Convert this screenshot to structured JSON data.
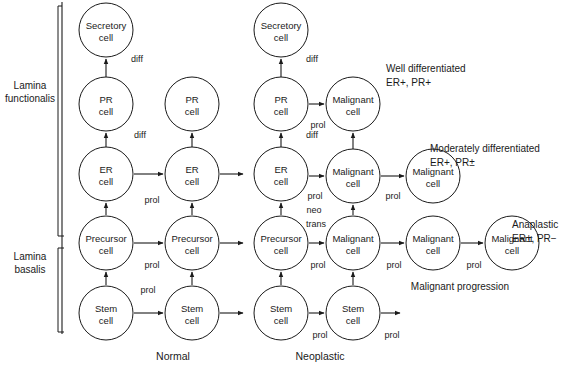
{
  "figure": {
    "columns": [
      {
        "id": "normal",
        "caption": "Normal",
        "x": 173,
        "y": 360
      },
      {
        "id": "neoplastic",
        "caption": "Neoplastic",
        "x": 320,
        "y": 360
      }
    ],
    "side_labels": [
      {
        "id": "lamina-functionalis",
        "line1": "Lamina",
        "line2": "functionalis",
        "x": 30,
        "y": 92
      },
      {
        "id": "lamina-basalis",
        "line1": "Lamina",
        "line2": "basalis",
        "x": 30,
        "y": 263
      }
    ],
    "progression_label": {
      "text": "Malignant progression",
      "x": 460,
      "y": 290
    },
    "annotations": [
      {
        "id": "well-differentiated",
        "line1": "Well differentiated",
        "line2": "ER+, PR+",
        "x": 386,
        "y": 72
      },
      {
        "id": "moderately-differentiated",
        "line1": "Moderately differentiated",
        "line2": "ER+, PR±",
        "x": 430,
        "y": 152
      },
      {
        "id": "anaplastic",
        "line1": "Anaplastic",
        "line2": "ER±, PR−",
        "x": 512,
        "y": 228
      }
    ],
    "cells": [
      {
        "id": "normal-secretory",
        "line1": "Secretory",
        "line2": "cell",
        "cx": 106,
        "cy": 30,
        "r": 27,
        "fill": "plain"
      },
      {
        "id": "normal-pr-1",
        "line1": "PR",
        "line2": "cell",
        "cx": 106,
        "cy": 104,
        "r": 27,
        "fill": "plain"
      },
      {
        "id": "normal-pr-2",
        "line1": "PR",
        "line2": "cell",
        "cx": 192,
        "cy": 104,
        "r": 27,
        "fill": "plain"
      },
      {
        "id": "normal-er-1",
        "line1": "ER",
        "line2": "cell",
        "cx": 106,
        "cy": 174,
        "r": 27,
        "fill": "plain"
      },
      {
        "id": "normal-er-2",
        "line1": "ER",
        "line2": "cell",
        "cx": 192,
        "cy": 174,
        "r": 27,
        "fill": "plain"
      },
      {
        "id": "normal-precursor-1",
        "line1": "Precursor",
        "line2": "cell",
        "cx": 106,
        "cy": 243,
        "r": 27,
        "fill": "plain"
      },
      {
        "id": "normal-precursor-2",
        "line1": "Precursor",
        "line2": "cell",
        "cx": 192,
        "cy": 243,
        "r": 27,
        "fill": "plain"
      },
      {
        "id": "normal-stem-1",
        "line1": "Stem",
        "line2": "cell",
        "cx": 106,
        "cy": 313,
        "r": 27,
        "fill": "plain"
      },
      {
        "id": "normal-stem-2",
        "line1": "Stem",
        "line2": "cell",
        "cx": 192,
        "cy": 313,
        "r": 27,
        "fill": "plain"
      },
      {
        "id": "neo-secretory",
        "line1": "Secretory",
        "line2": "cell",
        "cx": 281,
        "cy": 30,
        "r": 27,
        "fill": "plain"
      },
      {
        "id": "neo-pr",
        "line1": "PR",
        "line2": "cell",
        "cx": 281,
        "cy": 104,
        "r": 27,
        "fill": "plain"
      },
      {
        "id": "neo-malignant-well",
        "line1": "Malignant",
        "line2": "cell",
        "cx": 353,
        "cy": 104,
        "r": 27,
        "fill": "stripes"
      },
      {
        "id": "neo-er",
        "line1": "ER",
        "line2": "cell",
        "cx": 281,
        "cy": 174,
        "r": 27,
        "fill": "plain"
      },
      {
        "id": "neo-malignant-mod-1",
        "line1": "Malignant",
        "line2": "cell",
        "cx": 353,
        "cy": 176,
        "r": 27,
        "fill": "stipple"
      },
      {
        "id": "neo-malignant-mod-2",
        "line1": "Malignant",
        "line2": "cell",
        "cx": 433,
        "cy": 176,
        "r": 27,
        "fill": "stipple"
      },
      {
        "id": "neo-precursor",
        "line1": "Precursor",
        "line2": "cell",
        "cx": 281,
        "cy": 243,
        "r": 27,
        "fill": "plain"
      },
      {
        "id": "neo-malignant-ana-1",
        "line1": "Malignant",
        "line2": "cell",
        "cx": 353,
        "cy": 243,
        "r": 27,
        "fill": "plain"
      },
      {
        "id": "neo-malignant-ana-2",
        "line1": "Malignant",
        "line2": "cell",
        "cx": 433,
        "cy": 243,
        "r": 27,
        "fill": "plain"
      },
      {
        "id": "neo-malignant-ana-3",
        "line1": "Malignant",
        "line2": "cell",
        "cx": 512,
        "cy": 243,
        "r": 27,
        "fill": "plain"
      },
      {
        "id": "neo-stem-1",
        "line1": "Stem",
        "line2": "cell",
        "cx": 281,
        "cy": 313,
        "r": 27,
        "fill": "plain"
      },
      {
        "id": "neo-stem-2",
        "line1": "Stem",
        "line2": "cell",
        "cx": 353,
        "cy": 313,
        "r": 27,
        "fill": "plain"
      }
    ],
    "edge_labels": [
      {
        "id": "diff-normal-sec",
        "text": "diff",
        "x": 137,
        "y": 62
      },
      {
        "id": "diff-normal-pr",
        "text": "diff",
        "x": 140,
        "y": 138
      },
      {
        "id": "prol-normal-er",
        "text": "prol",
        "x": 152,
        "y": 203
      },
      {
        "id": "prol-normal-prec",
        "text": "prol",
        "x": 152,
        "y": 268
      },
      {
        "id": "prol-normal-stem",
        "text": "prol",
        "x": 148,
        "y": 293
      },
      {
        "id": "diff-neo-sec",
        "text": "diff",
        "x": 312,
        "y": 62
      },
      {
        "id": "prol-neo-pr",
        "text": "prol",
        "x": 318,
        "y": 128
      },
      {
        "id": "diff-neo-pr",
        "text": "diff",
        "x": 312,
        "y": 138
      },
      {
        "id": "prol-neo-er",
        "text": "prol",
        "x": 315,
        "y": 199
      },
      {
        "id": "neo-neo",
        "text": "neo",
        "x": 314,
        "y": 213
      },
      {
        "id": "trans-neo",
        "text": "trans",
        "x": 316,
        "y": 227
      },
      {
        "id": "prol-mod-1",
        "text": "prol",
        "x": 393,
        "y": 199
      },
      {
        "id": "prol-neo-prec",
        "text": "prol",
        "x": 318,
        "y": 268
      },
      {
        "id": "prol-ana-1",
        "text": "prol",
        "x": 394,
        "y": 268
      },
      {
        "id": "prol-ana-2",
        "text": "prol",
        "x": 474,
        "y": 268
      },
      {
        "id": "prol-neo-stem-1",
        "text": "prol",
        "x": 320,
        "y": 338
      },
      {
        "id": "prol-neo-stem-2",
        "text": "prol",
        "x": 392,
        "y": 338
      }
    ],
    "arrows": [
      {
        "id": "a-normal-pr-to-sec",
        "x1": 106,
        "y1": 77,
        "x2": 106,
        "y2": 59,
        "dir": "up"
      },
      {
        "id": "a-normal-er-to-pr",
        "x1": 106,
        "y1": 147,
        "x2": 106,
        "y2": 133,
        "dir": "up"
      },
      {
        "id": "a-normal-er2-to-pr2",
        "x1": 192,
        "y1": 147,
        "x2": 192,
        "y2": 133,
        "dir": "up"
      },
      {
        "id": "a-normal-er1-to-er2",
        "x1": 134,
        "y1": 174,
        "x2": 163,
        "y2": 174,
        "dir": "right"
      },
      {
        "id": "a-normal-er2-out",
        "x1": 220,
        "y1": 174,
        "x2": 243,
        "y2": 174,
        "dir": "right"
      },
      {
        "id": "a-normal-prec1-to-er1",
        "x1": 106,
        "y1": 215,
        "x2": 106,
        "y2": 203,
        "dir": "up"
      },
      {
        "id": "a-normal-prec2-to-er2",
        "x1": 192,
        "y1": 215,
        "x2": 192,
        "y2": 203,
        "dir": "up"
      },
      {
        "id": "a-normal-prec1-to-prec2",
        "x1": 134,
        "y1": 243,
        "x2": 163,
        "y2": 243,
        "dir": "right"
      },
      {
        "id": "a-normal-prec2-out",
        "x1": 220,
        "y1": 243,
        "x2": 243,
        "y2": 243,
        "dir": "right"
      },
      {
        "id": "a-normal-stem1-to-prec1",
        "x1": 106,
        "y1": 285,
        "x2": 106,
        "y2": 272,
        "dir": "up"
      },
      {
        "id": "a-normal-stem2-to-prec2",
        "x1": 192,
        "y1": 285,
        "x2": 192,
        "y2": 272,
        "dir": "up"
      },
      {
        "id": "a-normal-stem1-to-stem2",
        "x1": 134,
        "y1": 313,
        "x2": 163,
        "y2": 313,
        "dir": "right"
      },
      {
        "id": "a-normal-stem2-out",
        "x1": 220,
        "y1": 313,
        "x2": 243,
        "y2": 313,
        "dir": "right"
      },
      {
        "id": "a-neo-pr-to-sec",
        "x1": 281,
        "y1": 77,
        "x2": 281,
        "y2": 59,
        "dir": "up"
      },
      {
        "id": "a-neo-er-to-pr",
        "x1": 281,
        "y1": 147,
        "x2": 281,
        "y2": 133,
        "dir": "up"
      },
      {
        "id": "a-neo-pr-to-mal",
        "x1": 309,
        "y1": 104,
        "x2": 324,
        "y2": 104,
        "dir": "right"
      },
      {
        "id": "a-neo-malmod-to-malwell",
        "x1": 353,
        "y1": 149,
        "x2": 353,
        "y2": 133,
        "dir": "up"
      },
      {
        "id": "a-neo-er-to-malmod",
        "x1": 309,
        "y1": 176,
        "x2": 324,
        "y2": 176,
        "dir": "right"
      },
      {
        "id": "a-neo-malmod1-to-2",
        "x1": 381,
        "y1": 176,
        "x2": 404,
        "y2": 176,
        "dir": "right"
      },
      {
        "id": "a-neo-prec-to-er",
        "x1": 281,
        "y1": 215,
        "x2": 281,
        "y2": 203,
        "dir": "up"
      },
      {
        "id": "a-neo-malana-to-malmod",
        "x1": 353,
        "y1": 215,
        "x2": 353,
        "y2": 205,
        "dir": "up"
      },
      {
        "id": "a-neo-prec-to-malana",
        "x1": 309,
        "y1": 243,
        "x2": 324,
        "y2": 243,
        "dir": "right"
      },
      {
        "id": "a-neo-malana1-to-2",
        "x1": 381,
        "y1": 243,
        "x2": 404,
        "y2": 243,
        "dir": "right"
      },
      {
        "id": "a-neo-malana2-to-3",
        "x1": 461,
        "y1": 243,
        "x2": 483,
        "y2": 243,
        "dir": "right"
      },
      {
        "id": "a-neo-stem-to-prec",
        "x1": 281,
        "y1": 285,
        "x2": 281,
        "y2": 272,
        "dir": "up"
      },
      {
        "id": "a-neo-malana-to-stem2",
        "x1": 353,
        "y1": 285,
        "x2": 353,
        "y2": 272,
        "dir": "up"
      },
      {
        "id": "a-neo-stem1-to-stem2",
        "x1": 309,
        "y1": 313,
        "x2": 324,
        "y2": 313,
        "dir": "right"
      },
      {
        "id": "a-neo-stem2-out",
        "x1": 381,
        "y1": 313,
        "x2": 400,
        "y2": 313,
        "dir": "right"
      }
    ],
    "membrane": {
      "id": "basement-membrane-line",
      "x": 62,
      "y_top": 2,
      "y_bottom": 334,
      "bracket_functionalis": {
        "y_top": 6,
        "y_bottom": 236
      },
      "bracket_basalis": {
        "y_top": 248,
        "y_bottom": 332
      }
    },
    "colors": {
      "ink": "#1a1a1a",
      "paper": "#ffffff",
      "stipple": "#b9b9b9",
      "stripe": "#1a1a1a"
    }
  }
}
